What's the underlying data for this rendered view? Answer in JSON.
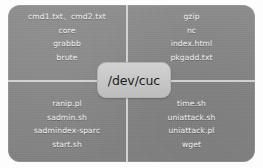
{
  "diagram": {
    "center": {
      "label": "/dev/cuc"
    },
    "colors": {
      "card_background": "#8a8a8a",
      "divider": "#d8d8d8",
      "file_text": "#f2f2f2",
      "center_fill": "#c9c9c9",
      "center_text": "#1b1b1b",
      "page_background": "#ffffff"
    },
    "quadrants": [
      {
        "position": "top-left",
        "items": [
          "cmd1.txt、cmd2.txt",
          "core",
          "grabbb",
          "brute"
        ]
      },
      {
        "position": "top-right",
        "items": [
          "gzip",
          "nc",
          "index.html",
          "pkgadd.txt"
        ]
      },
      {
        "position": "bottom-left",
        "items": [
          "ranip.pl",
          "sadmin.sh",
          "sadmindex-sparc",
          "start.sh"
        ]
      },
      {
        "position": "bottom-right",
        "items": [
          "time.sh",
          "uniattack.sh",
          "uniattack.pl",
          "wget"
        ]
      }
    ]
  }
}
